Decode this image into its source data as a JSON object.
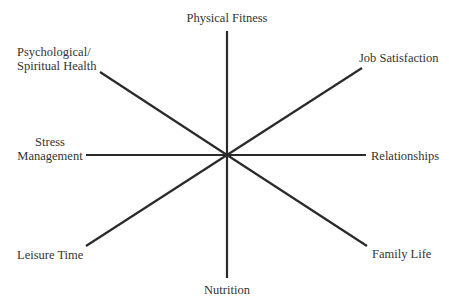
{
  "diagram": {
    "type": "wheel",
    "center": {
      "x": 227,
      "y": 155
    },
    "line_color": "#2a2a2a",
    "text_color": "#333333",
    "spokes": [
      {
        "name": "Physical Fitness",
        "x2": 227,
        "y2": 31
      },
      {
        "name": "Job Satisfaction",
        "x2": 362,
        "y2": 68
      },
      {
        "name": "Relationships",
        "x2": 366,
        "y2": 155
      },
      {
        "name": "Family Life",
        "x2": 367,
        "y2": 246
      },
      {
        "name": "Nutrition",
        "x2": 227,
        "y2": 278
      },
      {
        "name": "Leisure Time",
        "x2": 86,
        "y2": 246
      },
      {
        "name": "Stress Management",
        "x2": 86,
        "y2": 155
      },
      {
        "name": "Psychological/Spiritual Health",
        "x2": 100,
        "y2": 72
      }
    ],
    "labels": {
      "physical_fitness": "Physical Fitness",
      "psych_line1": "Psychological/",
      "psych_line2": "Spiritual Health",
      "job_satisfaction": "Job Satisfaction",
      "stress_line1": "Stress",
      "stress_line2": "Management",
      "relationships": "Relationships",
      "leisure_time": "Leisure Time",
      "family_life": "Family Life",
      "nutrition": "Nutrition"
    }
  }
}
